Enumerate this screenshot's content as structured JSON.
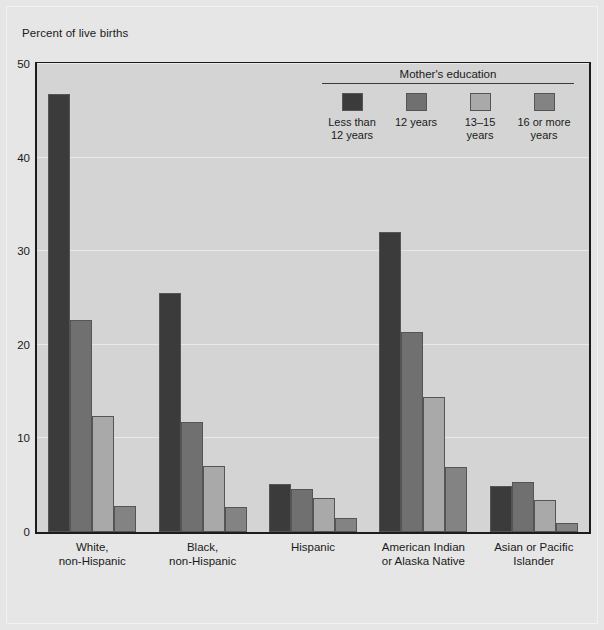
{
  "figure": {
    "axis_title": "Percent of live births",
    "background_color": "#e6e6e6",
    "plot_background_color": "#d4d4d4",
    "frame_color": "#1c1c1c"
  },
  "legend": {
    "title": "Mother's education",
    "position": "inside-top-right",
    "items": [
      {
        "label": "Less than\n12 years",
        "label_line1": "Less than",
        "label_line2": "12 years",
        "color": "#3b3b3b"
      },
      {
        "label": "12 years",
        "label_line1": "12 years",
        "label_line2": "",
        "color": "#707070"
      },
      {
        "label": "13–15 years",
        "label_line1": "13–15 years",
        "label_line2": "",
        "color": "#a9a9a9"
      },
      {
        "label": "16 or more\nyears",
        "label_line1": "16 or more",
        "label_line2": "years",
        "color": "#838383"
      }
    ]
  },
  "chart_data": {
    "type": "bar",
    "title": "",
    "subtitle": "",
    "xlabel": "",
    "ylabel": "Percent of live births",
    "ylim": [
      0,
      50
    ],
    "yticks": [
      0,
      10,
      20,
      30,
      40,
      50
    ],
    "ytick_labels": [
      "0",
      "10",
      "20",
      "30",
      "40",
      "50"
    ],
    "grid": true,
    "legend_position": "inside-top-right",
    "categories": [
      "White,\nnon-Hispanic",
      "Black,\nnon-Hispanic",
      "Hispanic",
      "American Indian\nor Alaska Native",
      "Asian or Pacific\nIslander"
    ],
    "category_lines": [
      [
        "White,",
        "non-Hispanic"
      ],
      [
        "Black,",
        "non-Hispanic"
      ],
      [
        "Hispanic",
        ""
      ],
      [
        "American Indian",
        "or Alaska Native"
      ],
      [
        "Asian or Pacific",
        "Islander"
      ]
    ],
    "series": [
      {
        "name": "Less than 12 years",
        "color": "#3b3b3b",
        "values": [
          46.8,
          25.5,
          5.1,
          32.0,
          4.9
        ]
      },
      {
        "name": "12 years",
        "color": "#707070",
        "values": [
          22.6,
          11.8,
          4.6,
          21.4,
          5.3
        ]
      },
      {
        "name": "13–15 years",
        "color": "#a9a9a9",
        "values": [
          12.4,
          7.1,
          3.6,
          14.4,
          3.4
        ]
      },
      {
        "name": "16 or more years",
        "color": "#838383",
        "values": [
          2.8,
          2.7,
          1.5,
          6.9,
          1.0
        ]
      }
    ]
  }
}
